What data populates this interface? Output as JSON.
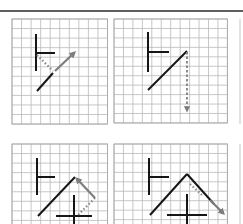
{
  "figure": {
    "top_rule": {
      "x1": 0,
      "x2": 243,
      "y": 11,
      "color": "#2a2a2a"
    },
    "colors": {
      "grid": "#b9b9b9",
      "ink": "#161616",
      "arrow": "#7d7d7d"
    },
    "panels": [
      {
        "id": "panel-1",
        "grid": {
          "x": 12,
          "y": 19,
          "cols": 10,
          "rows": 11,
          "cell": 9.55
        },
        "black_segments": [
          {
            "x1": 36,
            "y1": 34,
            "x2": 36,
            "y2": 71
          },
          {
            "x1": 36,
            "y1": 53,
            "x2": 55,
            "y2": 53
          },
          {
            "x1": 37,
            "y1": 91,
            "x2": 53,
            "y2": 73
          }
        ],
        "dotted": [
          {
            "x1": 37,
            "y1": 55,
            "x2": 53,
            "y2": 71
          }
        ],
        "arrows": [
          {
            "x1": 55,
            "y1": 71,
            "x2": 74,
            "y2": 53,
            "style": "solid"
          }
        ]
      },
      {
        "id": "panel-2",
        "grid": {
          "x": 114,
          "y": 19,
          "cols": 12,
          "rows": 11,
          "cell": 9.45
        },
        "black_segments": [
          {
            "x1": 148,
            "y1": 32,
            "x2": 148,
            "y2": 72
          },
          {
            "x1": 148,
            "y1": 52,
            "x2": 169,
            "y2": 52
          },
          {
            "x1": 148,
            "y1": 90,
            "x2": 187,
            "y2": 51
          }
        ],
        "dotted": [],
        "arrows": [
          {
            "x1": 187,
            "y1": 52,
            "x2": 187,
            "y2": 110,
            "style": "dash-dot"
          }
        ]
      },
      {
        "id": "panel-3",
        "grid": {
          "x": 12,
          "y": 144,
          "cols": 10,
          "rows": 9,
          "cell": 9.55
        },
        "black_segments": [
          {
            "x1": 37,
            "y1": 158,
            "x2": 37,
            "y2": 195
          },
          {
            "x1": 37,
            "y1": 177,
            "x2": 55,
            "y2": 177
          },
          {
            "x1": 38,
            "y1": 216,
            "x2": 75,
            "y2": 177
          },
          {
            "x1": 74,
            "y1": 195,
            "x2": 74,
            "y2": 224
          },
          {
            "x1": 56,
            "y1": 216,
            "x2": 92,
            "y2": 216
          }
        ],
        "dotted": [
          {
            "x1": 95,
            "y1": 198,
            "x2": 77,
            "y2": 216
          }
        ],
        "arrows": [
          {
            "x1": 95,
            "y1": 198,
            "x2": 77,
            "y2": 179,
            "style": "solid"
          }
        ]
      },
      {
        "id": "panel-4",
        "grid": {
          "x": 114,
          "y": 144,
          "cols": 12,
          "rows": 9,
          "cell": 9.45
        },
        "black_segments": [
          {
            "x1": 149,
            "y1": 158,
            "x2": 149,
            "y2": 195
          },
          {
            "x1": 149,
            "y1": 177,
            "x2": 169,
            "y2": 177
          },
          {
            "x1": 150,
            "y1": 215,
            "x2": 187,
            "y2": 174
          },
          {
            "x1": 187,
            "y1": 174,
            "x2": 214,
            "y2": 204
          },
          {
            "x1": 187,
            "y1": 194,
            "x2": 187,
            "y2": 224
          },
          {
            "x1": 167,
            "y1": 215,
            "x2": 207,
            "y2": 215
          }
        ],
        "dotted": [
          {
            "x1": 190,
            "y1": 184,
            "x2": 203,
            "y2": 196
          }
        ],
        "arrows": [
          {
            "x1": 210,
            "y1": 200,
            "x2": 223,
            "y2": 213,
            "style": "solid"
          }
        ]
      }
    ],
    "partial_third_column": {
      "x": 240,
      "visible": true
    }
  }
}
